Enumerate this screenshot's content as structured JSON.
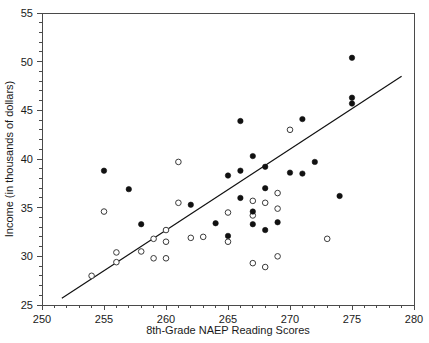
{
  "chart_data": {
    "type": "scatter",
    "title": "",
    "xlabel": "8th-Grade NAEP Reading Scores",
    "ylabel": "Income (in thousands of dollars)",
    "xlim": [
      250,
      280
    ],
    "ylim": [
      25,
      55
    ],
    "xticks": [
      250,
      255,
      260,
      265,
      270,
      275,
      280
    ],
    "xtick_labels": [
      "250",
      "255",
      "260",
      "265",
      "270",
      "275",
      "280"
    ],
    "yticks": [
      25,
      30,
      35,
      40,
      45,
      50,
      55
    ],
    "ytick_labels": [
      "25",
      "30",
      "35",
      "40",
      "45",
      "50",
      "55"
    ],
    "x_minor_tick_step": 1,
    "y_minor_tick_step": 1,
    "grid": false,
    "legend": null,
    "series": [
      {
        "name": "filled-markers",
        "marker": "filled-circle",
        "color": "#111111",
        "points": [
          [
            255.0,
            38.8
          ],
          [
            257.0,
            36.9
          ],
          [
            258.0,
            33.3
          ],
          [
            262.0,
            35.3
          ],
          [
            264.0,
            33.4
          ],
          [
            265.0,
            38.3
          ],
          [
            265.0,
            32.1
          ],
          [
            266.0,
            43.9
          ],
          [
            266.0,
            38.8
          ],
          [
            266.0,
            36.0
          ],
          [
            267.0,
            40.3
          ],
          [
            267.0,
            34.6
          ],
          [
            267.0,
            33.3
          ],
          [
            268.0,
            39.2
          ],
          [
            268.0,
            37.0
          ],
          [
            268.0,
            32.7
          ],
          [
            269.0,
            33.5
          ],
          [
            270.0,
            38.6
          ],
          [
            271.0,
            44.1
          ],
          [
            271.0,
            38.5
          ],
          [
            272.0,
            39.7
          ],
          [
            274.0,
            36.2
          ],
          [
            275.0,
            50.4
          ],
          [
            275.0,
            46.3
          ],
          [
            275.0,
            45.7
          ]
        ]
      },
      {
        "name": "open-markers",
        "marker": "open-circle",
        "color": "#3a3a3a",
        "points": [
          [
            254.0,
            28.0
          ],
          [
            255.0,
            34.6
          ],
          [
            256.0,
            30.4
          ],
          [
            256.0,
            29.4
          ],
          [
            258.0,
            30.5
          ],
          [
            259.0,
            31.8
          ],
          [
            259.0,
            29.8
          ],
          [
            260.0,
            32.7
          ],
          [
            260.0,
            31.5
          ],
          [
            260.0,
            29.8
          ],
          [
            261.0,
            39.7
          ],
          [
            261.0,
            35.5
          ],
          [
            262.0,
            31.9
          ],
          [
            263.0,
            32.0
          ],
          [
            265.0,
            34.5
          ],
          [
            265.0,
            31.5
          ],
          [
            267.0,
            35.7
          ],
          [
            267.0,
            34.2
          ],
          [
            267.0,
            29.3
          ],
          [
            268.0,
            35.5
          ],
          [
            268.0,
            28.9
          ],
          [
            269.0,
            36.5
          ],
          [
            269.0,
            34.9
          ],
          [
            269.0,
            30.0
          ],
          [
            270.0,
            43.0
          ],
          [
            273.0,
            31.8
          ]
        ]
      }
    ],
    "fit_line": {
      "name": "regression-line",
      "x_start": 251.6,
      "y_start": 25.7,
      "x_end": 279.0,
      "y_end": 48.5
    }
  }
}
